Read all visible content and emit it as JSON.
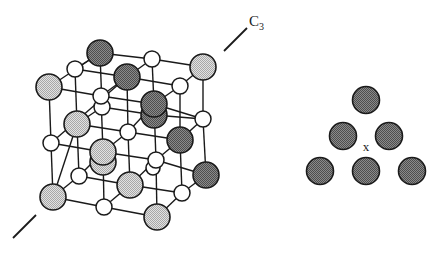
{
  "figure": {
    "axis_label": "C",
    "axis_subscript": "3",
    "center_marker": "x",
    "colors": {
      "dark_atom": "#6e6e6e",
      "light_atom": "#c4c4c4",
      "small_atom": "#ffffff",
      "stroke": "#1a1a1a"
    }
  },
  "cube": {
    "description": "rock-salt lattice viewed along C3 axis",
    "large_dark_atoms": [
      [
        100,
        53
      ],
      [
        127,
        77
      ],
      [
        154,
        104
      ],
      [
        180,
        140
      ],
      [
        206,
        175
      ]
    ],
    "large_light_atoms": [
      [
        203,
        67
      ],
      [
        49,
        87
      ],
      [
        77,
        124
      ],
      [
        103,
        152
      ],
      [
        130,
        185
      ],
      [
        53,
        197
      ],
      [
        157,
        217
      ]
    ],
    "small_atoms": [
      [
        75,
        69
      ],
      [
        152,
        59
      ],
      [
        101,
        96
      ],
      [
        180,
        86
      ],
      [
        102,
        107
      ],
      [
        203,
        119
      ],
      [
        51,
        143
      ],
      [
        128,
        132
      ],
      [
        156,
        160
      ],
      [
        79,
        176
      ],
      [
        182,
        193
      ],
      [
        104,
        207
      ]
    ]
  },
  "triangle": {
    "description": "triangular layer of atoms viewed down C3 axis",
    "atoms": [
      [
        366,
        100
      ],
      [
        343,
        136
      ],
      [
        389,
        136
      ],
      [
        320,
        171
      ],
      [
        366,
        171
      ],
      [
        412,
        171
      ]
    ],
    "marker_pos": [
      366,
      148
    ]
  }
}
